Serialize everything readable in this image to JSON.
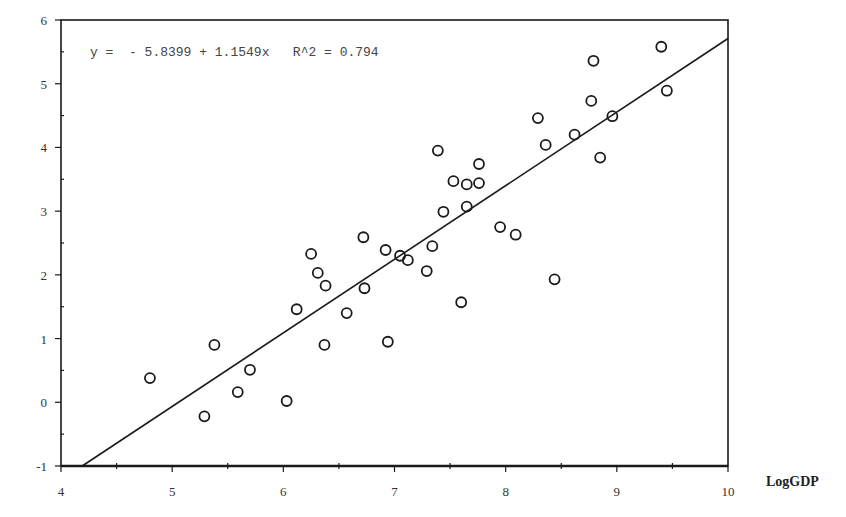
{
  "chart_data": {
    "type": "scatter",
    "title": "",
    "xlabel": "LogGDP",
    "ylabel": "",
    "xlim": [
      4,
      10
    ],
    "ylim": [
      -1,
      6
    ],
    "x_ticks": [
      4,
      5,
      6,
      7,
      8,
      9,
      10
    ],
    "y_ticks": [
      -1,
      0,
      1,
      2,
      3,
      4,
      5,
      6
    ],
    "grid": false,
    "legend": null,
    "annotation": "y =  - 5.8399 + 1.1549x   R^2 = 0.794",
    "regression": {
      "intercept": -5.8399,
      "slope": 1.1549,
      "r_squared": 0.794
    },
    "marker": "open-circle",
    "points": [
      {
        "x": 4.8,
        "y": 0.38
      },
      {
        "x": 5.29,
        "y": -0.22
      },
      {
        "x": 5.38,
        "y": 0.9
      },
      {
        "x": 5.59,
        "y": 0.16
      },
      {
        "x": 5.7,
        "y": 0.51
      },
      {
        "x": 6.03,
        "y": 0.02
      },
      {
        "x": 6.12,
        "y": 1.46
      },
      {
        "x": 6.25,
        "y": 2.33
      },
      {
        "x": 6.31,
        "y": 2.03
      },
      {
        "x": 6.38,
        "y": 1.83
      },
      {
        "x": 6.37,
        "y": 0.9
      },
      {
        "x": 6.57,
        "y": 1.4
      },
      {
        "x": 6.72,
        "y": 2.59
      },
      {
        "x": 6.73,
        "y": 1.79
      },
      {
        "x": 6.92,
        "y": 2.39
      },
      {
        "x": 6.94,
        "y": 0.95
      },
      {
        "x": 7.05,
        "y": 2.3
      },
      {
        "x": 7.12,
        "y": 2.23
      },
      {
        "x": 7.29,
        "y": 2.06
      },
      {
        "x": 7.34,
        "y": 2.45
      },
      {
        "x": 7.39,
        "y": 3.95
      },
      {
        "x": 7.44,
        "y": 2.99
      },
      {
        "x": 7.53,
        "y": 3.47
      },
      {
        "x": 7.6,
        "y": 1.57
      },
      {
        "x": 7.65,
        "y": 3.42
      },
      {
        "x": 7.65,
        "y": 3.07
      },
      {
        "x": 7.76,
        "y": 3.74
      },
      {
        "x": 7.76,
        "y": 3.44
      },
      {
        "x": 7.95,
        "y": 2.75
      },
      {
        "x": 8.09,
        "y": 2.63
      },
      {
        "x": 8.29,
        "y": 4.46
      },
      {
        "x": 8.36,
        "y": 4.04
      },
      {
        "x": 8.44,
        "y": 1.93
      },
      {
        "x": 8.62,
        "y": 4.2
      },
      {
        "x": 8.77,
        "y": 4.73
      },
      {
        "x": 8.79,
        "y": 5.36
      },
      {
        "x": 8.85,
        "y": 3.84
      },
      {
        "x": 8.96,
        "y": 4.49
      },
      {
        "x": 9.4,
        "y": 5.58
      },
      {
        "x": 9.45,
        "y": 4.89
      }
    ]
  },
  "colors": {
    "axis": "#1a1a1a",
    "marker": "#1a1a1a",
    "line": "#1a1a1a",
    "background": "#ffffff"
  }
}
